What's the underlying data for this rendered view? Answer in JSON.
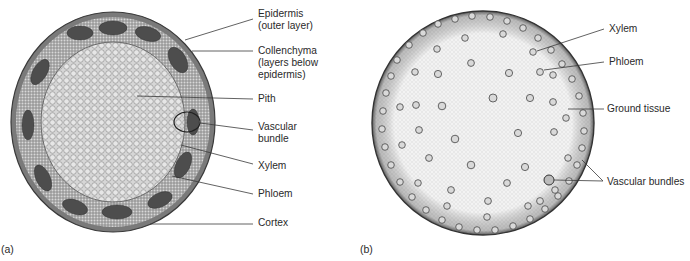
{
  "figure_a": {
    "panel_label": "(a)",
    "description": "Cross-section of dicot stem",
    "labels": {
      "epidermis": "Epidermis\n(outer layer)",
      "collenchyma": "Collenchyma\n(layers below\nepidermis)",
      "pith": "Pith",
      "vascular_bundle": "Vascular\nbundle",
      "xylem": "Xylem",
      "phloem": "Phloem",
      "cortex": "Cortex"
    }
  },
  "figure_b": {
    "panel_label": "(b)",
    "description": "Cross-section of monocot stem",
    "labels": {
      "xylem": "Xylem",
      "phloem": "Phloem",
      "ground_tissue": "Ground tissue",
      "vascular_bundles": "Vascular bundles"
    }
  },
  "colors": {
    "line": "#3a3a3a",
    "text": "#2a2a2a",
    "dark_tissue": "#4a4a4a",
    "pith": "#d8d8d8",
    "ground": "#f2f2f2"
  }
}
